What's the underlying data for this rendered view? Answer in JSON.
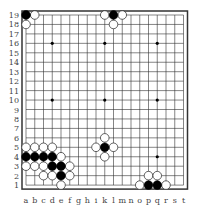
{
  "board": {
    "size": 19,
    "column_labels": [
      "a",
      "b",
      "c",
      "d",
      "e",
      "f",
      "g",
      "h",
      "i",
      "k",
      "l",
      "m",
      "n",
      "o",
      "p",
      "q",
      "r",
      "s",
      "t"
    ],
    "row_labels": [
      "19",
      "18",
      "17",
      "16",
      "15",
      "14",
      "13",
      "12",
      "11",
      "10",
      "9",
      "8",
      "7",
      "6",
      "5",
      "4",
      "3",
      "2",
      "1"
    ],
    "star_points": [
      "d16",
      "k16",
      "q16",
      "d10",
      "k10",
      "q10",
      "d4",
      "k4",
      "q4"
    ],
    "black_stones": [
      "a19",
      "l19",
      "k5",
      "a4",
      "b4",
      "c4",
      "d4",
      "d3",
      "e3",
      "e2",
      "p1",
      "q1"
    ],
    "white_stones": [
      "b19",
      "a18",
      "k19",
      "m19",
      "l18",
      "k6",
      "i5",
      "l5",
      "k4",
      "a5",
      "b5",
      "c5",
      "d5",
      "e4",
      "a3",
      "b3",
      "c3",
      "f3",
      "c2",
      "d2",
      "f2",
      "e1",
      "o1",
      "r1",
      "p2",
      "q2"
    ],
    "colors": {
      "line": "#333333",
      "black": "#000000",
      "white": "#ffffff",
      "label": "#444444"
    }
  }
}
